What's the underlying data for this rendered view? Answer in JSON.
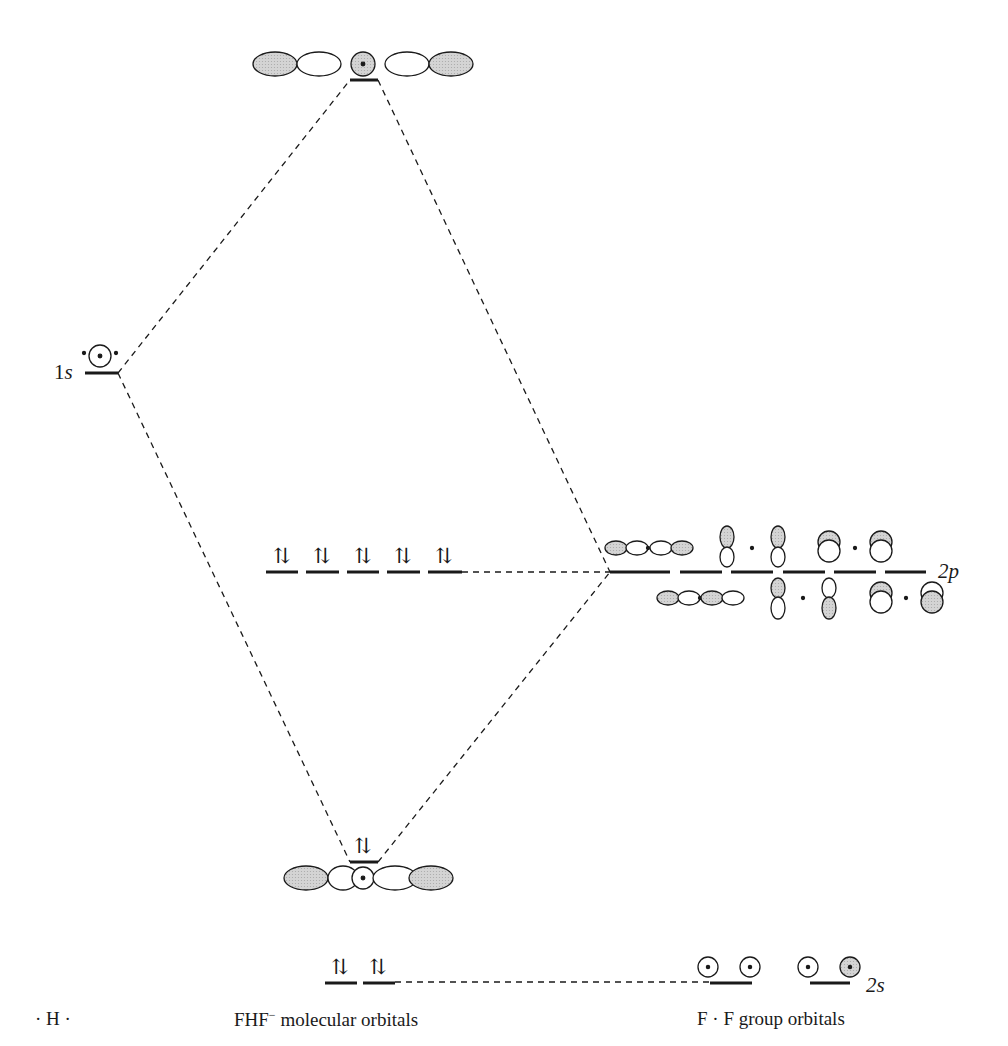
{
  "diagram": {
    "left_label": "· H ·",
    "center_label_prefix": "FHF",
    "center_label_sup": "−",
    "center_label_suffix": " molecular orbitals",
    "right_label": "F · F group orbitals",
    "h_orbital_label": "1s",
    "f_2p_label": "2p",
    "f_2s_label": "2s",
    "electron_pair_symbol": "⇅",
    "levels": [
      {
        "name": "antibonding-sigma",
        "occupancy": 0
      },
      {
        "name": "h-1s",
        "occupancy": 1
      },
      {
        "name": "nonbonding-2p",
        "count": 5,
        "occupancy": 2
      },
      {
        "name": "f-2p-group",
        "count": 6
      },
      {
        "name": "bonding-sigma",
        "occupancy": 2
      },
      {
        "name": "nonbonding-2s",
        "count": 2,
        "occupancy": 2
      },
      {
        "name": "f-2s-group",
        "count": 2
      }
    ],
    "colors": {
      "shaded_lobe": "#c8c8c8",
      "line": "#1a1a1a"
    }
  }
}
